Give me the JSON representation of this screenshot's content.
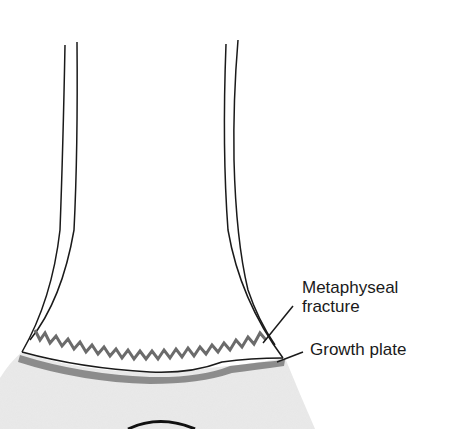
{
  "diagram": {
    "labels": [
      {
        "id": "metaphyseal-fracture",
        "lines": [
          "Metaphyseal",
          "fracture"
        ]
      },
      {
        "id": "growth-plate",
        "lines": [
          "Growth plate"
        ]
      }
    ],
    "colors": {
      "outline": "#1a1a1a",
      "fracture": "#6b6b6b",
      "growth_plate": "#8c8c8c",
      "epiphysis": "#e2e2e2"
    }
  }
}
